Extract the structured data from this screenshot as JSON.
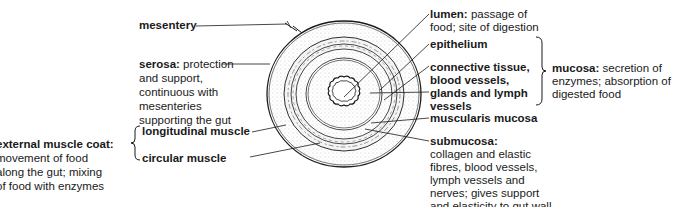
{
  "labels": {
    "mesentery": "mesentery",
    "serosa": {
      "name": "serosa:",
      "desc_1": " protection",
      "line_2": "and support,",
      "line_3": "continuous with",
      "line_4": "mesenteries",
      "line_5": "supporting the gut"
    },
    "external_muscle": {
      "name": "external muscle coat:",
      "line_2": "movement of food",
      "line_3": "along the gut; mixing",
      "line_4": "of food with enzymes"
    },
    "longitudinal_muscle": "longitudinal muscle",
    "circular_muscle": "circular muscle",
    "lumen": {
      "name": "lumen:",
      "desc_1": " passage of",
      "line_2": "food; site of digestion"
    },
    "epithelium": "epithelium",
    "connective": {
      "line_1": "connective tissue,",
      "line_2": "blood vessels,",
      "line_3": "glands and lymph",
      "line_4": "vessels"
    },
    "muscularis_mucosa": "muscularis mucosa",
    "mucosa": {
      "name": "mucosa:",
      "desc_1": " secretion of",
      "line_2": "enzymes; absorption of",
      "line_3": "digested food"
    },
    "submucosa": {
      "name": "submucosa:",
      "line_2": "collagen and elastic",
      "line_3": "fibres, blood vessels,",
      "line_4": "lymph vessels and",
      "line_5": "nerves; gives support",
      "line_6": "and elasticity to gut wall"
    }
  },
  "colors": {
    "ink": "#1a1a1a",
    "stipple": "#d9d9d9",
    "background": "#ffffff"
  }
}
